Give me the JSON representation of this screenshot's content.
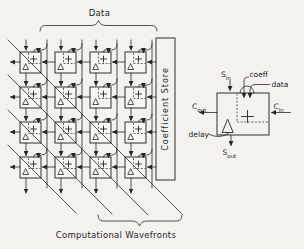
{
  "colors": {
    "ink": "#262626",
    "paper": "#f3f2ef"
  },
  "array": {
    "grid": {
      "rows": 4,
      "cols": 4
    },
    "labels": {
      "data": "Data",
      "coefficient_store": "Coefficient Store",
      "wavefronts": "Computational Wavefronts"
    },
    "wavefront_count": 4,
    "pe_symbols": {
      "accumulate": "+",
      "delay": "Δ"
    }
  },
  "detail": {
    "labels": {
      "s_in": {
        "base": "S",
        "sub": "in"
      },
      "coeff": "coeff",
      "data": "data",
      "c_out": {
        "base": "C",
        "sub": "out"
      },
      "c_in": {
        "base": "C",
        "sub": "in"
      },
      "delay": "delay",
      "s_out": {
        "base": "S",
        "sub": "out"
      }
    },
    "symbols": {
      "accumulate": "+",
      "delay": "Δ"
    }
  },
  "icons": {
    "plus": "plus-icon",
    "delay_triangle": "delta-delay-icon",
    "arrowhead": "arrow-marker",
    "data_tap": "data-tap-arc"
  }
}
